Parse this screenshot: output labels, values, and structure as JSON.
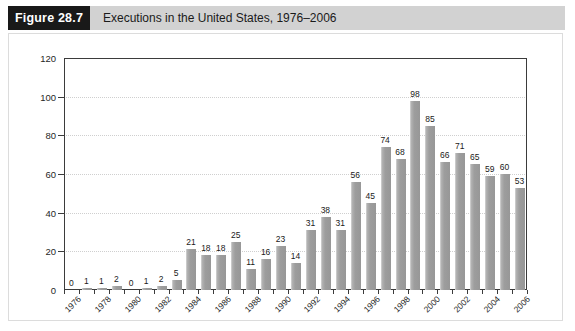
{
  "header": {
    "figure_number": "Figure 28.7",
    "title": "Executions in the United States, 1976–2006",
    "block_color": "#191919",
    "bar_color": "#d2d2d2"
  },
  "chart_data": {
    "type": "bar",
    "title": "Executions in the United States, 1976–2006",
    "xlabel": "",
    "ylabel": "",
    "ylim": [
      0,
      120
    ],
    "yticks": [
      0,
      20,
      40,
      60,
      80,
      100,
      120
    ],
    "grid": true,
    "legend": "none",
    "xtick_interval": 2,
    "xtick_labels": [
      "1976",
      "1978",
      "1980",
      "1982",
      "1984",
      "1986",
      "1988",
      "1990",
      "1992",
      "1994",
      "1996",
      "1998",
      "2000",
      "2002",
      "2004",
      "2006"
    ],
    "categories": [
      "1976",
      "1977",
      "1978",
      "1979",
      "1980",
      "1981",
      "1982",
      "1983",
      "1984",
      "1985",
      "1986",
      "1987",
      "1988",
      "1989",
      "1990",
      "1991",
      "1992",
      "1993",
      "1994",
      "1995",
      "1996",
      "1997",
      "1998",
      "1999",
      "2000",
      "2001",
      "2002",
      "2003",
      "2004",
      "2005",
      "2006"
    ],
    "values": [
      0,
      1,
      1,
      2,
      0,
      1,
      2,
      5,
      21,
      18,
      18,
      25,
      11,
      16,
      23,
      14,
      31,
      38,
      31,
      56,
      45,
      74,
      68,
      98,
      85,
      66,
      71,
      65,
      59,
      60,
      53
    ],
    "bar_color": "#9d9d9d",
    "axis_color": "#3b3b3b"
  }
}
